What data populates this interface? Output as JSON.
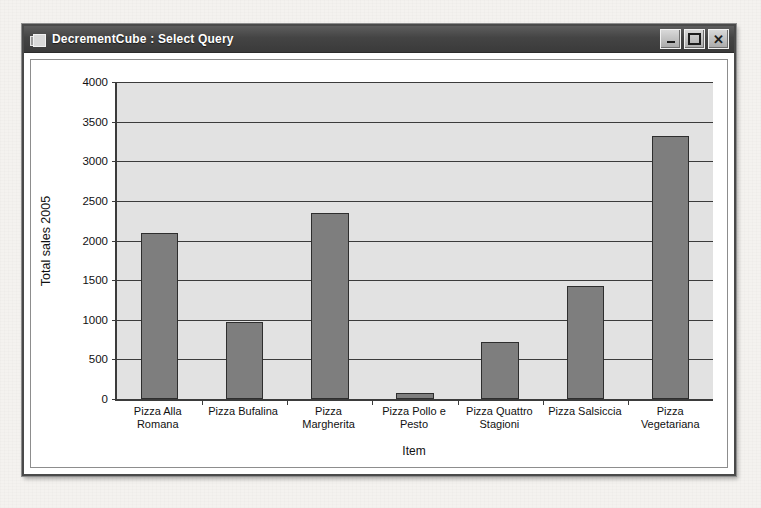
{
  "window": {
    "title": "DecrementCube : Select Query",
    "icon": "query-window-icon",
    "buttons": {
      "minimize": "_",
      "maximize": "□",
      "close": "✕"
    }
  },
  "chart_data": {
    "type": "bar",
    "title": "",
    "xlabel": "Item",
    "ylabel": "Total sales 2005",
    "categories": [
      "Pizza Alla Romana",
      "Pizza Bufalina",
      "Pizza Margherita",
      "Pizza Pollo e Pesto",
      "Pizza Quattro Stagioni",
      "Pizza Salsiccia",
      "Pizza Vegetariana"
    ],
    "values": [
      2100,
      975,
      2350,
      70,
      720,
      1420,
      3320
    ],
    "ylim": [
      0,
      4000
    ],
    "yticks": [
      0,
      500,
      1000,
      1500,
      2000,
      2500,
      3000,
      3500,
      4000
    ],
    "grid": true,
    "legend": false,
    "bar_color": "#7e7e7e",
    "plot_background": "#e2e2e2",
    "axis_color": "#3b3b3b"
  }
}
